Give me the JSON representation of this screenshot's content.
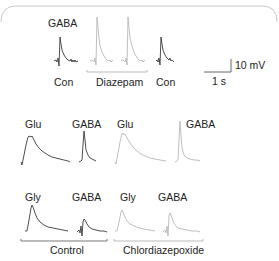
{
  "panel_a": {
    "drug_label": "GABA",
    "conditions": [
      {
        "label": "Con",
        "trace_style": "dark"
      },
      {
        "label": "Diazepam",
        "trace_style": "light",
        "trace_count": 2
      },
      {
        "label": "Con",
        "trace_style": "dark"
      }
    ],
    "scale_bar": {
      "vertical": "10 mV",
      "horizontal": "1 s"
    }
  },
  "panel_b": {
    "control": [
      {
        "label": "Glu",
        "trace_style": "dark"
      },
      {
        "label": "GABA",
        "trace_style": "dark"
      }
    ],
    "drug": [
      {
        "label": "Glu",
        "trace_style": "light"
      },
      {
        "label": "GABA",
        "trace_style": "light"
      }
    ]
  },
  "panel_c": {
    "control": [
      {
        "label": "Gly",
        "trace_style": "dark"
      },
      {
        "label": "GABA",
        "trace_style": "dark"
      }
    ],
    "drug": [
      {
        "label": "Gly",
        "trace_style": "light"
      },
      {
        "label": "GABA",
        "trace_style": "light"
      }
    ],
    "group_labels": {
      "control": "Control",
      "drug": "Chlordiazepoxide"
    }
  },
  "colors": {
    "control_trace": "#3a3a3a",
    "drug_trace": "#b8b8b8",
    "text": "#222222"
  }
}
